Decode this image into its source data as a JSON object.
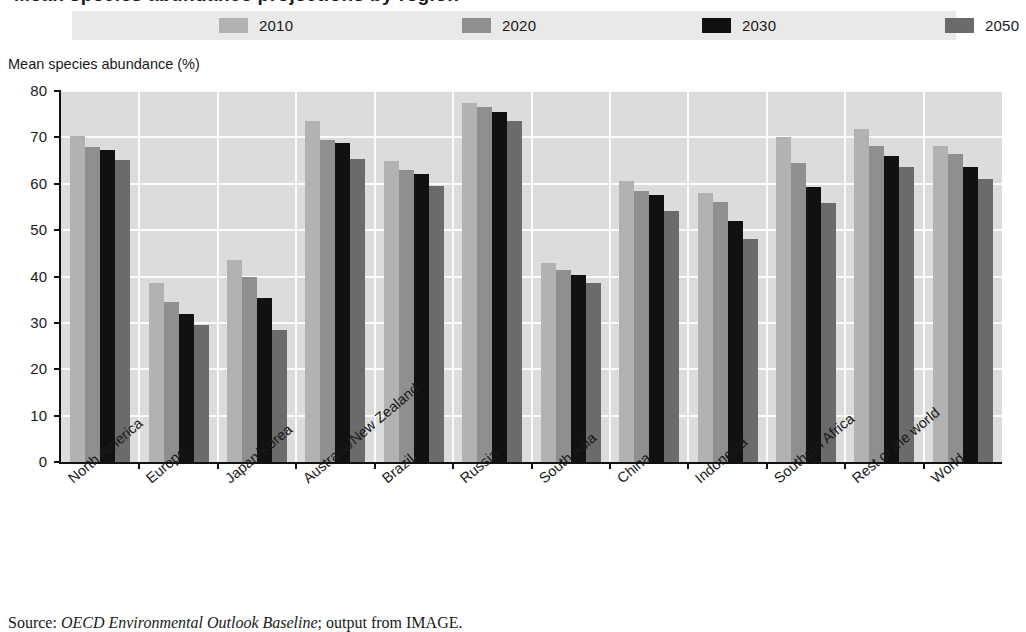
{
  "figure": {
    "title": "Mean species abundance projections by region",
    "source_prefix": "Source:",
    "source_italic": "OECD Environmental Outlook Baseline",
    "source_suffix": "; output from IMAGE."
  },
  "legend": {
    "position": "top",
    "entries": [
      {
        "label": "2010",
        "color": "#b2b2b2"
      },
      {
        "label": "2020",
        "color": "#8f8f8f"
      },
      {
        "label": "2030",
        "color": "#111111"
      },
      {
        "label": "2050",
        "color": "#6b6b6b"
      }
    ]
  },
  "axes": {
    "y_title": "Mean species abundance (%)",
    "y_ticks": [
      "0",
      "10",
      "20",
      "30",
      "40",
      "50",
      "60",
      "70",
      "80"
    ]
  },
  "chart_data": {
    "type": "bar",
    "title": "Mean species abundance projections by region",
    "xlabel": "",
    "ylabel": "Mean species abundance (%)",
    "ylim": [
      0,
      80
    ],
    "ytick_step": 10,
    "grid": true,
    "legend_position": "top",
    "categories": [
      "North America",
      "Europe",
      "Japan/Korea",
      "Australia/New Zealand",
      "Brazil",
      "Russia",
      "South Asia",
      "China",
      "Indonesia",
      "Southern Africa",
      "Rest of the world",
      "World"
    ],
    "series": [
      {
        "name": "2010",
        "color": "#b2b2b2",
        "values": [
          70.3,
          38.5,
          43.5,
          73.5,
          65.0,
          77.5,
          43.0,
          60.5,
          58.0,
          70.0,
          71.8,
          68.2
        ]
      },
      {
        "name": "2020",
        "color": "#8f8f8f",
        "values": [
          68.0,
          34.5,
          40.0,
          69.5,
          63.0,
          76.5,
          41.5,
          58.5,
          56.0,
          64.5,
          68.2,
          66.5
        ]
      },
      {
        "name": "2030",
        "color": "#111111",
        "values": [
          67.2,
          32.0,
          35.3,
          68.8,
          62.0,
          75.5,
          40.3,
          57.5,
          52.0,
          59.2,
          66.0,
          63.7
        ]
      },
      {
        "name": "2050",
        "color": "#6b6b6b",
        "values": [
          65.2,
          29.5,
          28.5,
          65.3,
          59.5,
          73.5,
          38.5,
          54.2,
          48.0,
          55.8,
          63.7,
          61.0
        ]
      }
    ]
  }
}
